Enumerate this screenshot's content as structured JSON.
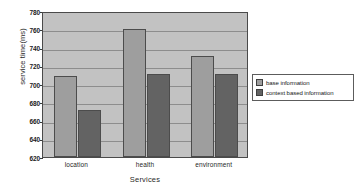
{
  "chart_data": {
    "type": "bar",
    "title": "",
    "xlabel": "Services",
    "ylabel": "service time(ms)",
    "categories": [
      "location",
      "health",
      "environment"
    ],
    "series": [
      {
        "name": "base information",
        "values": [
          709,
          760,
          731
        ],
        "color": "#9e9e9e"
      },
      {
        "name": "context based information",
        "values": [
          672,
          711,
          711
        ],
        "color": "#636363"
      }
    ],
    "ylim": [
      620,
      780
    ],
    "yticks": [
      620,
      640,
      660,
      680,
      700,
      720,
      740,
      760,
      780
    ],
    "ytick_labels": [
      "620",
      "640",
      "660",
      "680",
      "700",
      "720",
      "740",
      "760",
      "780"
    ],
    "grid": true,
    "legend_position": "right",
    "plot_background": "#c2c2c2",
    "axis_color": "#4a4a4a",
    "gridline_color": "#8d8d8d"
  }
}
